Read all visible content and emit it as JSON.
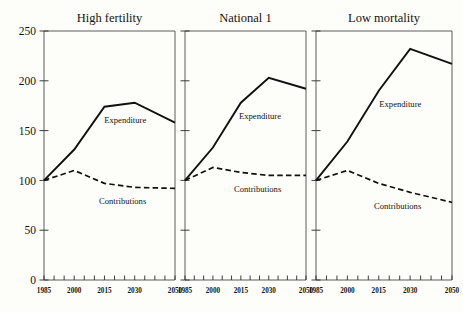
{
  "chart_data": {
    "type": "line",
    "title": "",
    "xlabel": "",
    "ylabel": "",
    "xlim": [
      1985,
      2050
    ],
    "ylim": [
      0,
      250
    ],
    "grid": false,
    "legend": "inline-annotations",
    "x": [
      1985,
      2000,
      2015,
      2030,
      2050
    ],
    "xtick_labels": [
      "1985",
      "2000",
      "2015",
      "2030",
      "2050"
    ],
    "ytick_labels": [
      "0",
      "50",
      "100",
      "150",
      "200",
      "250"
    ],
    "ytick_values": [
      0,
      50,
      100,
      150,
      200,
      250
    ],
    "minor_tick_years": [
      1985,
      1990,
      1995,
      2000,
      2005,
      2010,
      2015,
      2020,
      2025,
      2030,
      2035,
      2040,
      2045,
      2050
    ],
    "panels": [
      {
        "title": "High fertility",
        "series": [
          {
            "name": "Expenditure",
            "style": "solid",
            "label": "Expenditure",
            "values": [
              100,
              131,
              174,
              178,
              158
            ]
          },
          {
            "name": "Contributions",
            "style": "dashed",
            "label": "Contributions",
            "values": [
              100,
              110,
              97,
              93,
              92
            ]
          }
        ]
      },
      {
        "title": "National 1",
        "series": [
          {
            "name": "Expenditure",
            "style": "solid",
            "label": "Expenditure",
            "values": [
              100,
              133,
              178,
              203,
              192
            ]
          },
          {
            "name": "Contributions",
            "style": "dashed",
            "label": "Contributions",
            "values": [
              100,
              113,
              108,
              105,
              105
            ]
          }
        ]
      },
      {
        "title": "Low mortality",
        "series": [
          {
            "name": "Expenditure",
            "style": "solid",
            "label": "Expenditure",
            "values": [
              100,
              139,
              190,
              232,
              217
            ]
          },
          {
            "name": "Contributions",
            "style": "dashed",
            "label": "Contributions",
            "values": [
              100,
              110,
              97,
              88,
              78
            ]
          }
        ]
      }
    ]
  },
  "style": {
    "background": "#fdfdfa",
    "line_color": "#111111",
    "axis_color": "#4a4a4a",
    "text_color": "#141414"
  }
}
